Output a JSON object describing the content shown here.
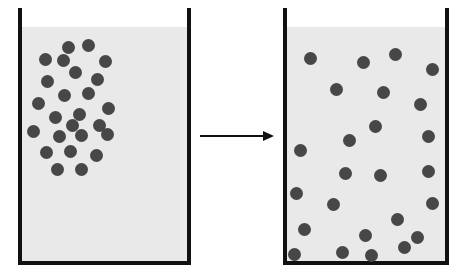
{
  "diagram": {
    "caption": "",
    "background_color": "#ffffff",
    "liquid_color": "#e9e9e9",
    "wall_color": "#111111",
    "particle_color": "#474747",
    "arrow_color": "#111111",
    "particle_diameter": 13
  },
  "arrow": {
    "name": "process-arrow",
    "label": "",
    "x1": 200,
    "y1": 136,
    "x2": 274,
    "y2": 136,
    "head_length": 11,
    "head_half_width": 5,
    "stroke_width": 2
  },
  "containers": [
    {
      "id": "left-beaker",
      "label": "Before diffusion",
      "state": "concentrated",
      "particle_count": 25,
      "geometry": {
        "left": 18,
        "right": 191,
        "top": 8,
        "bottom": 265,
        "liquid_top": 27,
        "wall_thickness": 4
      },
      "particles": [
        {
          "cx": 68,
          "cy": 47
        },
        {
          "cx": 88,
          "cy": 45
        },
        {
          "cx": 45,
          "cy": 59
        },
        {
          "cx": 105,
          "cy": 61
        },
        {
          "cx": 75,
          "cy": 72
        },
        {
          "cx": 47,
          "cy": 81
        },
        {
          "cx": 97,
          "cy": 79
        },
        {
          "cx": 64,
          "cy": 95
        },
        {
          "cx": 88,
          "cy": 93
        },
        {
          "cx": 38,
          "cy": 103
        },
        {
          "cx": 108,
          "cy": 108
        },
        {
          "cx": 55,
          "cy": 117
        },
        {
          "cx": 79,
          "cy": 114
        },
        {
          "cx": 99,
          "cy": 125
        },
        {
          "cx": 33,
          "cy": 131
        },
        {
          "cx": 59,
          "cy": 136
        },
        {
          "cx": 81,
          "cy": 135
        },
        {
          "cx": 107,
          "cy": 134
        },
        {
          "cx": 46,
          "cy": 152
        },
        {
          "cx": 70,
          "cy": 151
        },
        {
          "cx": 96,
          "cy": 155
        },
        {
          "cx": 57,
          "cy": 169
        },
        {
          "cx": 81,
          "cy": 169
        },
        {
          "cx": 72,
          "cy": 125
        },
        {
          "cx": 63,
          "cy": 60
        }
      ]
    },
    {
      "id": "right-beaker",
      "label": "After diffusion",
      "state": "uniform",
      "particle_count": 25,
      "geometry": {
        "left": 283,
        "right": 449,
        "top": 8,
        "bottom": 265,
        "liquid_top": 27,
        "wall_thickness": 4
      },
      "particles": [
        {
          "cx": 310,
          "cy": 58
        },
        {
          "cx": 363,
          "cy": 62
        },
        {
          "cx": 395,
          "cy": 54
        },
        {
          "cx": 432,
          "cy": 69
        },
        {
          "cx": 336,
          "cy": 89
        },
        {
          "cx": 383,
          "cy": 92
        },
        {
          "cx": 428,
          "cy": 136
        },
        {
          "cx": 300,
          "cy": 150
        },
        {
          "cx": 375,
          "cy": 126
        },
        {
          "cx": 349,
          "cy": 140
        },
        {
          "cx": 420,
          "cy": 104
        },
        {
          "cx": 296,
          "cy": 193
        },
        {
          "cx": 345,
          "cy": 173
        },
        {
          "cx": 380,
          "cy": 175
        },
        {
          "cx": 428,
          "cy": 171
        },
        {
          "cx": 333,
          "cy": 204
        },
        {
          "cx": 397,
          "cy": 219
        },
        {
          "cx": 432,
          "cy": 203
        },
        {
          "cx": 304,
          "cy": 229
        },
        {
          "cx": 365,
          "cy": 235
        },
        {
          "cx": 404,
          "cy": 247
        },
        {
          "cx": 294,
          "cy": 254
        },
        {
          "cx": 342,
          "cy": 252
        },
        {
          "cx": 371,
          "cy": 255
        },
        {
          "cx": 417,
          "cy": 237
        }
      ]
    }
  ]
}
